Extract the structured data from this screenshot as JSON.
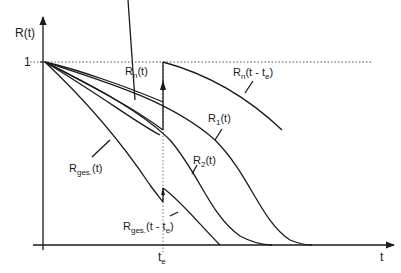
{
  "diagram": {
    "y_axis_label": "R(t)",
    "x_axis_label": "t",
    "y_tick_one": "1",
    "x_tick_te": {
      "main": "t",
      "sub": "e"
    },
    "curves": [
      {
        "id": "Rn",
        "main": "R",
        "sub": "n",
        "rest": "(t)"
      },
      {
        "id": "Rn_shift",
        "main": "R",
        "sub": "n",
        "rest": "(t - t",
        "sub2": "e",
        "rest2": ")"
      },
      {
        "id": "R1",
        "main": "R",
        "sub": "1",
        "rest": "(t)"
      },
      {
        "id": "R2",
        "main": "R",
        "sub": "2",
        "rest": "(t)"
      },
      {
        "id": "Rges",
        "main": "R",
        "sub": "ges.",
        "rest": "(t)"
      },
      {
        "id": "Rges_shift",
        "main": "R",
        "sub": "ges.",
        "rest": "(t - t",
        "sub2": "e",
        "rest2": ")"
      }
    ],
    "colors": {
      "line": "#1a1a1a",
      "dotted": "#555555"
    }
  }
}
